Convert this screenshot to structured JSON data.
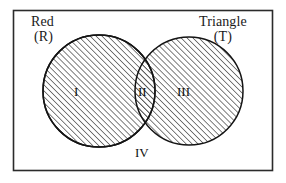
{
  "figure": {
    "type": "venn-diagram",
    "background_color": "#ffffff",
    "frame": {
      "name": "universal-set-rectangle",
      "stroke_color": "#2b2b2b",
      "x": 13,
      "y": 10,
      "width": 260,
      "height": 161
    },
    "sets": [
      {
        "id": "R",
        "name": "Red",
        "symbol": "(R)",
        "position": "left",
        "center_x": 99,
        "center_y": 91,
        "radius": 56,
        "fill": "diagonal-hatch",
        "stroke_color": "#1a1a1a"
      },
      {
        "id": "T",
        "name": "Triangle",
        "symbol": "(T)",
        "position": "right",
        "center_x": 189,
        "center_y": 91,
        "radius": 54,
        "fill": "diagonal-hatch",
        "stroke_color": "#1a1a1a"
      }
    ],
    "regions": [
      {
        "id": "I",
        "label": "I",
        "meaning": "Red only"
      },
      {
        "id": "II",
        "label": "II",
        "meaning": "Red and Triangle"
      },
      {
        "id": "III",
        "label": "III",
        "meaning": "Triangle only"
      },
      {
        "id": "IV",
        "label": "IV",
        "meaning": "Neither Red nor Triangle"
      }
    ],
    "hatch": {
      "angle_degrees": 45,
      "spacing_px": 3,
      "line_color": "#4a4a4a"
    }
  }
}
